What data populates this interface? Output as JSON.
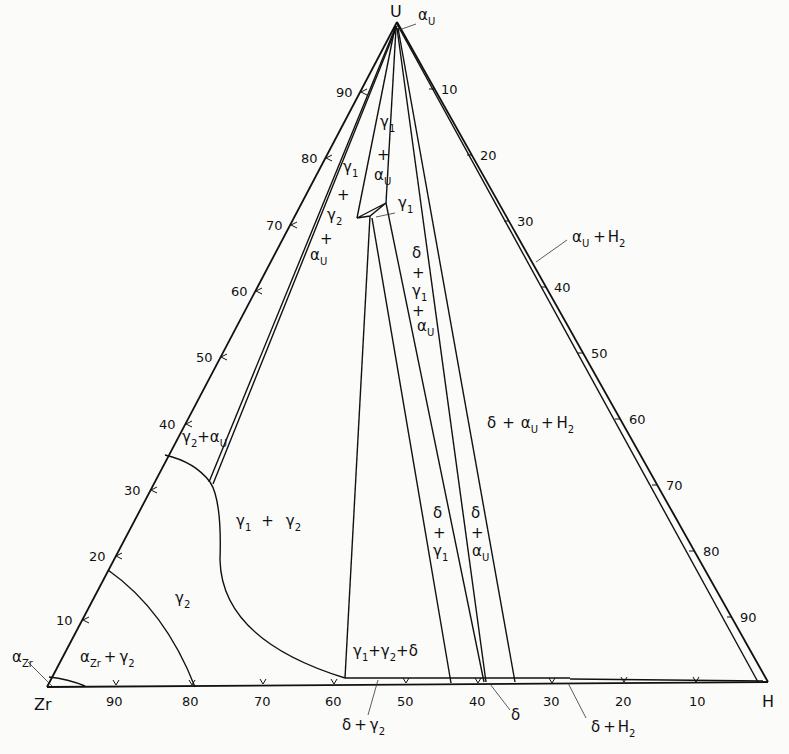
{
  "diagram": {
    "title": "",
    "type": "ternary phase diagram",
    "corners": {
      "top": {
        "label": "U",
        "x": 397,
        "y": 22
      },
      "left": {
        "label": "Zr",
        "x": 47,
        "y": 687
      },
      "right": {
        "label": "H",
        "x": 768,
        "y": 682
      }
    },
    "left_axis_ticks": [
      "10",
      "20",
      "30",
      "40",
      "50",
      "60",
      "70",
      "80",
      "90"
    ],
    "right_axis_ticks": [
      "10",
      "20",
      "30",
      "40",
      "50",
      "60",
      "70",
      "80",
      "90"
    ],
    "bottom_axis_ticks": [
      "90",
      "80",
      "70",
      "60",
      "50",
      "40",
      "30",
      "20",
      "10"
    ],
    "phase_regions": [
      {
        "id": "alpha_u",
        "label": "α_U"
      },
      {
        "id": "gamma1_alphau",
        "label": "γ1 + αU"
      },
      {
        "id": "gamma1_gamma2_alphau",
        "label": "γ1 + γ2 + αU"
      },
      {
        "id": "gamma1",
        "label": "γ1"
      },
      {
        "id": "delta_gamma1_alphau",
        "label": "δ + γ1 + αU"
      },
      {
        "id": "alphau_h2",
        "label": "αU + H2"
      },
      {
        "id": "delta_alphau_h2",
        "label": "δ + αU + H2"
      },
      {
        "id": "gamma2_alphau",
        "label": "γ2 + αU"
      },
      {
        "id": "gamma1_gamma2",
        "label": "γ1 + γ2"
      },
      {
        "id": "delta_gamma1",
        "label": "δ + γ1"
      },
      {
        "id": "delta_alphau",
        "label": "δ + αU"
      },
      {
        "id": "gamma2",
        "label": "γ2"
      },
      {
        "id": "alpha_zr",
        "label": "αZr"
      },
      {
        "id": "alphazr_gamma2",
        "label": "αZr + γ2"
      },
      {
        "id": "gamma1_gamma2_delta",
        "label": "γ1 + γ2 + δ"
      },
      {
        "id": "delta_gamma2",
        "label": "δ + γ2"
      },
      {
        "id": "delta",
        "label": "δ"
      },
      {
        "id": "delta_h2",
        "label": "δ + H2"
      }
    ]
  },
  "text": {
    "U": "U",
    "Zr": "Zr",
    "H": "H",
    "alpha": "α",
    "gamma": "γ",
    "delta": "δ",
    "plus": "+",
    "sub_U": "U",
    "sub_Zr": "Zr",
    "sub_1": "1",
    "sub_2": "2",
    "H2": "H",
    "gamma1_plus": "γ",
    "plus_sign": "+",
    "l10": "10",
    "l20": "20",
    "l30": "30",
    "l40": "40",
    "l50": "50",
    "l60": "60",
    "l70": "70",
    "l80": "80",
    "l90": "90"
  }
}
